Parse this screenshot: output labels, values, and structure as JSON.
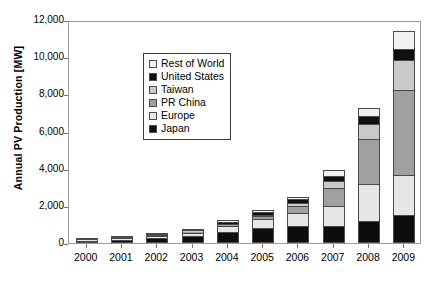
{
  "chart_data": {
    "type": "bar",
    "stacked": true,
    "title": "",
    "xlabel": "",
    "ylabel": "Annual PV Production [MW]",
    "categories": [
      "2000",
      "2001",
      "2002",
      "2003",
      "2004",
      "2005",
      "2006",
      "2007",
      "2008",
      "2009"
    ],
    "ylim": [
      0,
      12000
    ],
    "ytick_values": [
      0,
      2000,
      4000,
      6000,
      8000,
      10000,
      12000
    ],
    "ytick_labels": [
      "0",
      "2,000",
      "4,000",
      "6,000",
      "8,000",
      "10,000",
      "12,000"
    ],
    "grid": false,
    "legend_position": "upper-left inside plot",
    "series": [
      {
        "name": "Japan",
        "color": "#0d0d0d",
        "values": [
          130,
          170,
          250,
          360,
          600,
          830,
          930,
          920,
          1200,
          1500
        ]
      },
      {
        "name": "Europe",
        "color": "#e6e6e6",
        "values": [
          60,
          90,
          140,
          200,
          320,
          470,
          700,
          1050,
          1950,
          2150
        ]
      },
      {
        "name": "PR China",
        "color": "#a0a0a0",
        "values": [
          10,
          15,
          30,
          55,
          80,
          140,
          380,
          1000,
          2450,
          4600
        ]
      },
      {
        "name": "Taiwan",
        "color": "#c9c9c9",
        "values": [
          5,
          8,
          15,
          25,
          40,
          80,
          160,
          350,
          800,
          1600
        ]
      },
      {
        "name": "United States",
        "color": "#101010",
        "values": [
          25,
          30,
          50,
          70,
          110,
          150,
          190,
          280,
          420,
          580
        ]
      },
      {
        "name": "Rest of World",
        "color": "#f1f1f1",
        "values": [
          10,
          12,
          20,
          30,
          50,
          80,
          130,
          330,
          450,
          1000
        ]
      }
    ],
    "totals": [
      240,
      325,
      505,
      740,
      1200,
      1750,
      2490,
      3930,
      7270,
      11430
    ],
    "legend_entries": [
      {
        "label": "Rest of World",
        "color": "#f1f1f1"
      },
      {
        "label": "United States",
        "color": "#101010"
      },
      {
        "label": "Taiwan",
        "color": "#c9c9c9"
      },
      {
        "label": "PR China",
        "color": "#a0a0a0"
      },
      {
        "label": "Europe",
        "color": "#e6e6e6"
      },
      {
        "label": "Japan",
        "color": "#0d0d0d"
      }
    ]
  }
}
